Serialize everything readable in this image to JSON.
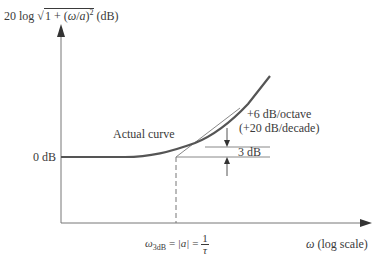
{
  "diagram": {
    "type": "bode-magnitude-plot",
    "y_axis_label": {
      "prefix": "20 log",
      "radicand_start": "1 + (",
      "omega": "ω",
      "slash": "/",
      "a": "a",
      "radicand_end": ")",
      "exponent": "2",
      "unit": "(dB)"
    },
    "x_axis_label": {
      "omega": "ω",
      "text": "(log scale)"
    },
    "zero_db_label": "0 dB",
    "actual_curve_label": "Actual curve",
    "slope_label_1": "+6 dB/octave",
    "slope_label_2": "(+20 dB/decade)",
    "three_db_label": "3 dB",
    "corner_label": {
      "omega": "ω",
      "subscript": "3dB",
      "eq1": "=",
      "abs_a": "|a|",
      "eq2": "=",
      "frac_num": "1",
      "frac_den": "τ"
    },
    "colors": {
      "ink": "#3a3a3a",
      "curve": "#555555",
      "background": "#ffffff"
    }
  }
}
